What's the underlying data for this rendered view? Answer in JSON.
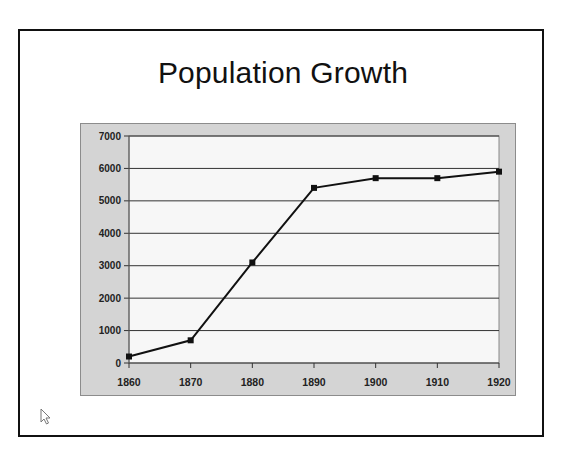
{
  "slide": {
    "title": "Population Growth"
  },
  "chart_data": {
    "type": "line",
    "title": "Population Growth",
    "xlabel": "",
    "ylabel": "",
    "categories": [
      "1860",
      "1870",
      "1880",
      "1890",
      "1900",
      "1910",
      "1920"
    ],
    "series": [
      {
        "name": "Population",
        "values": [
          200,
          700,
          3100,
          5400,
          5700,
          5700,
          5900
        ]
      }
    ],
    "ylim": [
      0,
      7000
    ],
    "yticks": [
      0,
      1000,
      2000,
      3000,
      4000,
      5000,
      6000,
      7000
    ],
    "grid": "horizontal",
    "legend": "none",
    "marker": "square",
    "colors": {
      "line": "#111111",
      "plot_bg": "#f7f7f7",
      "chart_bg": "#d4d4d4",
      "grid": "#333333"
    }
  }
}
